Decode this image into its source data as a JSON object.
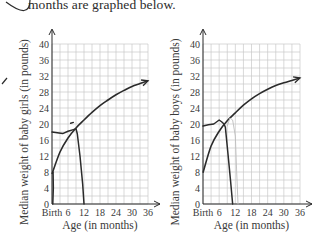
{
  "caption": "months are graphed below.",
  "chart_data": [
    {
      "type": "line",
      "title": "",
      "xlabel": "Age (in months)",
      "ylabel": "Median weight of baby girls (in pounds)",
      "x_tick_labels": [
        "Birth",
        "6",
        "12",
        "18",
        "24",
        "30",
        "36"
      ],
      "x_ticks": [
        0,
        6,
        12,
        18,
        24,
        30,
        36
      ],
      "y_ticks": [
        0,
        4,
        8,
        12,
        16,
        20,
        24,
        28,
        32,
        36,
        40
      ],
      "xlim": [
        0,
        36
      ],
      "ylim": [
        0,
        40
      ],
      "grid": true,
      "series": [
        {
          "name": "Median weight of baby girls",
          "x": [
            0,
            3,
            6,
            9,
            12,
            15,
            18,
            21,
            24,
            27,
            30,
            33,
            36
          ],
          "y": [
            7.5,
            13,
            16.5,
            19,
            21,
            22.9,
            24.6,
            26,
            27.3,
            28.4,
            29.4,
            30.1,
            30.8
          ]
        }
      ],
      "annotations": [
        {
          "kind": "hand-drawn",
          "description": "pen line near 18 lb from birth to ~9 months then dropping to 0 at ~12 months",
          "x": [
            0,
            2,
            4,
            6,
            8,
            9,
            9.5,
            10.5,
            11.5,
            12
          ],
          "y": [
            18,
            17.8,
            17.6,
            18.2,
            18.6,
            18.8,
            17.5,
            12,
            5,
            0
          ]
        },
        {
          "kind": "hand-drawn",
          "description": "vertical pen stroke along y-axis from 0 to 8 lb",
          "x": [
            0.3,
            0.5,
            0.4
          ],
          "y": [
            0,
            4,
            8
          ]
        },
        {
          "kind": "hand-drawn",
          "description": "small dash above curve near 7 months",
          "x": [
            7,
            8
          ],
          "y": [
            20.2,
            20.4
          ]
        }
      ]
    },
    {
      "type": "line",
      "title": "",
      "xlabel": "Age (in months)",
      "ylabel": "Median weight of baby boys (in pounds)",
      "x_tick_labels": [
        "Birth",
        "6",
        "12",
        "18",
        "24",
        "30",
        "36"
      ],
      "x_ticks": [
        0,
        6,
        12,
        18,
        24,
        30,
        36
      ],
      "y_ticks": [
        0,
        4,
        8,
        12,
        16,
        20,
        24,
        28,
        32,
        36,
        40
      ],
      "xlim": [
        0,
        36
      ],
      "ylim": [
        0,
        40
      ],
      "grid": true,
      "series": [
        {
          "name": "Median weight of baby boys",
          "x": [
            0,
            3,
            6,
            9,
            12,
            15,
            18,
            21,
            24,
            27,
            30,
            33,
            36
          ],
          "y": [
            7.8,
            14.5,
            18.2,
            20.8,
            22.8,
            24.7,
            26.3,
            27.6,
            28.7,
            29.6,
            30.3,
            30.9,
            31.5
          ]
        }
      ],
      "annotations": [
        {
          "kind": "hand-drawn",
          "description": "pen line near 19.5 lb from birth to ~8 months then dropping to 0 at ~11 months",
          "x": [
            0,
            2,
            4,
            6,
            7,
            7.8,
            8.3,
            9.2,
            10.2,
            11
          ],
          "y": [
            19.5,
            19.8,
            20,
            21,
            20.5,
            20,
            19.2,
            13,
            6,
            0
          ]
        },
        {
          "kind": "hand-drawn",
          "description": "faint pencil line from ~9 months at 20 lb up to ~22 lb then down to 0 near 13 months",
          "x": [
            9,
            10,
            11,
            12,
            12.5,
            13
          ],
          "y": [
            19.5,
            21.5,
            21,
            17,
            8,
            0
          ]
        }
      ]
    }
  ],
  "decor": {
    "ink_color": "#2b2b2b",
    "grid_color": "#c9c9c9",
    "pencil_color": "#bdbdbd"
  }
}
